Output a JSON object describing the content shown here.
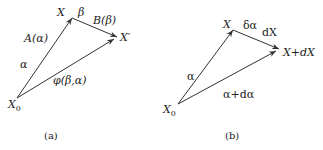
{
  "panels": [
    {
      "caption": "(a)",
      "points": {
        "origin": {
          "label": "X",
          "sub": "0"
        },
        "mid": {
          "label": "X"
        },
        "end": {
          "label": "X′"
        }
      },
      "edges": {
        "origin_to_mid": {
          "upper_label": "A(α)",
          "lower_label": "α"
        },
        "mid_to_end": {
          "upper_label": "B(β)",
          "near_label": "β"
        },
        "origin_to_end": {
          "label": "φ(β,α)"
        }
      }
    },
    {
      "caption": "(b)",
      "points": {
        "origin": {
          "label": "X",
          "sub": "0"
        },
        "mid": {
          "label": "X"
        },
        "end": {
          "label": "X+dX"
        }
      },
      "edges": {
        "origin_to_mid": {
          "lower_label": "α"
        },
        "mid_to_end": {
          "near_label": "δα",
          "upper_label": "dX"
        },
        "origin_to_end": {
          "label": "α+dα"
        }
      }
    }
  ]
}
